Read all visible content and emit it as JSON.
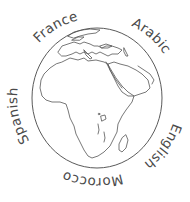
{
  "illustration": {
    "subject": "globe",
    "colors": {
      "background": "#ffffff",
      "line": "#555555",
      "text": "#4a4a4a"
    },
    "labels": [
      {
        "id": "france",
        "text": "France"
      },
      {
        "id": "arabic",
        "text": "Arabic"
      },
      {
        "id": "english",
        "text": "English"
      },
      {
        "id": "morocco",
        "text": "Morocco"
      },
      {
        "id": "spanish",
        "text": "Spanish"
      }
    ]
  }
}
